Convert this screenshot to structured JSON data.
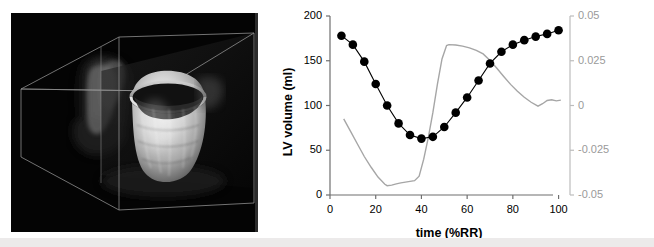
{
  "figure": {
    "panel_a": {
      "name": "3d-lv-volume-rendering",
      "description": "3D volume rendering of left ventricle cast inside wireframe bounding box",
      "background_color": "#040404",
      "wire_color": "#8a8a8a"
    }
  },
  "chart_data": {
    "type": "line",
    "title": "",
    "xlabel": "time (%RR)",
    "ylabel": "LV volume (ml)",
    "y2label": "d(LV volume)/dt (EDV/%RR)",
    "xlim": [
      0,
      105
    ],
    "ylim": [
      0,
      200
    ],
    "y2lim": [
      -0.05,
      0.05
    ],
    "xticks": [
      0,
      20,
      40,
      60,
      80,
      100
    ],
    "xticklabels": [
      "0",
      "20",
      "40",
      "60",
      "80",
      "100"
    ],
    "yticks": [
      0,
      50,
      100,
      150,
      200
    ],
    "yticklabels": [
      "0",
      "50",
      "100",
      "150",
      "200"
    ],
    "y2ticks": [
      -0.05,
      -0.025,
      0,
      0.025,
      0.05
    ],
    "y2ticklabels": [
      "-0.05",
      "-0.025",
      "0",
      "0.025",
      "0.05"
    ],
    "grid": false,
    "legend": null,
    "series": [
      {
        "name": "LV volume",
        "axis": "left",
        "marker": "filled-circle",
        "color": "#000000",
        "x": [
          5,
          10,
          15,
          20,
          25,
          30,
          35,
          40,
          45,
          50,
          55,
          60,
          65,
          70,
          75,
          80,
          85,
          90,
          95,
          100
        ],
        "values": [
          178,
          168,
          149,
          124,
          100,
          80,
          67,
          63,
          65,
          76,
          92,
          109,
          128,
          147,
          160,
          168,
          173,
          177,
          180,
          184
        ]
      },
      {
        "name": "d(LV volume)/dt",
        "axis": "right",
        "marker": "none",
        "color": "#a6a6a6",
        "x": [
          6,
          9,
          12,
          15,
          18,
          21,
          24,
          25,
          27,
          29,
          31,
          33,
          35,
          37,
          39,
          41,
          43,
          45,
          47,
          49,
          51,
          52,
          55,
          58,
          61,
          64,
          67,
          70,
          73,
          76,
          79,
          82,
          85,
          88,
          91,
          93,
          95,
          97,
          99,
          101
        ],
        "values": [
          -0.0075,
          -0.0145,
          -0.0215,
          -0.0285,
          -0.0345,
          -0.04,
          -0.044,
          -0.0448,
          -0.0445,
          -0.0438,
          -0.0432,
          -0.0428,
          -0.0424,
          -0.042,
          -0.0395,
          -0.03,
          -0.018,
          -0.004,
          0.012,
          0.026,
          0.0335,
          0.034,
          0.0338,
          0.0332,
          0.0322,
          0.0308,
          0.0288,
          0.0252,
          0.0208,
          0.0162,
          0.0118,
          0.008,
          0.0046,
          0.0018,
          -0.0004,
          0.001,
          0.0028,
          0.0032,
          0.0026,
          0.003
        ]
      }
    ]
  }
}
